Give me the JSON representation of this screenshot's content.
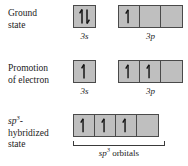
{
  "figure": {
    "colors": {
      "box_fill": "#bfbfbf",
      "box_border": "#4a4a4a",
      "text": "#1b1b1b",
      "background": "#ffffff"
    }
  },
  "rows": [
    {
      "id": "ground-state",
      "label_lines": [
        "Ground",
        "state"
      ],
      "groups": [
        {
          "id": "3s",
          "caption_main": "3",
          "caption_sub": "s",
          "caption_sup": "",
          "boxes": [
            {
              "electrons": [
                "up",
                "down"
              ]
            }
          ]
        },
        {
          "id": "3p",
          "caption_main": "3",
          "caption_sub": "p",
          "caption_sup": "",
          "boxes": [
            {
              "electrons": [
                "up"
              ]
            },
            {
              "electrons": []
            },
            {
              "electrons": []
            }
          ]
        }
      ]
    },
    {
      "id": "promotion-of-electron",
      "label_lines": [
        "Promotion",
        "of electron"
      ],
      "groups": [
        {
          "id": "3s",
          "caption_main": "3",
          "caption_sub": "s",
          "caption_sup": "",
          "boxes": [
            {
              "electrons": [
                "up"
              ]
            }
          ]
        },
        {
          "id": "3p",
          "caption_main": "3",
          "caption_sub": "p",
          "caption_sup": "",
          "boxes": [
            {
              "electrons": [
                "up"
              ]
            },
            {
              "electrons": [
                "up"
              ]
            },
            {
              "electrons": []
            }
          ]
        }
      ]
    },
    {
      "id": "sp3-hybridized-state",
      "label_lines_rich": [
        {
          "italic": "sp",
          "sup": "3",
          "tail": "-"
        },
        {
          "italic": "",
          "sup": "",
          "tail": "hybridized"
        },
        {
          "italic": "",
          "sup": "",
          "tail": "state"
        }
      ],
      "groups": [
        {
          "id": "sp3",
          "caption_italic": "sp",
          "caption_sup": "3",
          "caption_tail": " orbitals",
          "boxes": [
            {
              "electrons": [
                "up"
              ]
            },
            {
              "electrons": [
                "up"
              ]
            },
            {
              "electrons": [
                "up"
              ]
            },
            {
              "electrons": []
            }
          ]
        }
      ]
    }
  ],
  "captions": {
    "row1_3s": "3s",
    "row1_3p": "3p",
    "row2_3s": "3s",
    "row2_3p": "3p",
    "row3_sp3": "sp3 orbitals"
  }
}
